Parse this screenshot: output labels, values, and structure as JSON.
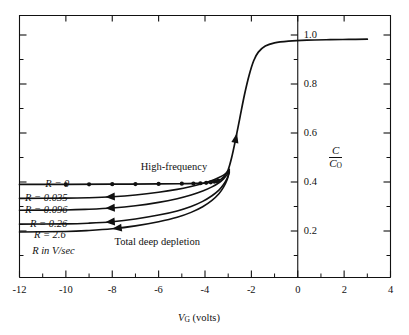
{
  "chart_data": {
    "type": "line",
    "title": "",
    "xlabel": "V_G (volts)",
    "ylabel": "C/C_O",
    "xlim": [
      -12,
      4
    ],
    "ylim": [
      0,
      1.08
    ],
    "xticks": [
      -12,
      -10,
      -8,
      -6,
      -4,
      -2,
      0,
      2,
      4
    ],
    "xtick_labels": [
      "-12",
      "-10",
      "-8",
      "-6",
      "-4",
      "-2",
      "0",
      "2",
      "4"
    ],
    "xminor_ticks": [
      -11,
      -9,
      -7,
      -5,
      -3,
      -1,
      1,
      3
    ],
    "yticks": [
      0.2,
      0.4,
      0.6,
      0.8,
      1.0
    ],
    "ytick_labels": [
      "0.2",
      "0.4",
      "0.6",
      "0.8",
      "1.0"
    ],
    "yminor_ticks": [
      0.1,
      0.3,
      0.5,
      0.7,
      0.9
    ],
    "y_axis_position": "x=0",
    "grid": false,
    "legend": "inline-labels",
    "annotations": [
      {
        "text": "High-frequency",
        "x": -5.3,
        "y": 0.455
      },
      {
        "text": "Total deep depletion",
        "x": -6.1,
        "y": 0.155
      }
    ],
    "series": [
      {
        "name": "R = 0",
        "label": "R = 0",
        "marker": "filled-circle",
        "comment": "high-frequency curve, flat at C/Co = 0.39 then rises into inversion branch",
        "points": [
          [
            -12,
            0.39
          ],
          [
            -10,
            0.39
          ],
          [
            -8,
            0.391
          ],
          [
            -6,
            0.392
          ],
          [
            -5,
            0.393
          ],
          [
            -4.4,
            0.394
          ],
          [
            -4.0,
            0.396
          ],
          [
            -3.7,
            0.399
          ],
          [
            -3.45,
            0.404
          ],
          [
            -3.3,
            0.412
          ],
          [
            -3.15,
            0.425
          ],
          [
            -3.0,
            0.45
          ],
          [
            -2.85,
            0.5
          ],
          [
            -2.7,
            0.565
          ],
          [
            -2.5,
            0.66
          ],
          [
            -2.3,
            0.755
          ],
          [
            -2.1,
            0.835
          ],
          [
            -1.9,
            0.895
          ],
          [
            -1.7,
            0.93
          ],
          [
            -1.4,
            0.955
          ],
          [
            -1.0,
            0.968
          ],
          [
            -0.4,
            0.975
          ],
          [
            0.4,
            0.979
          ],
          [
            1.4,
            0.981
          ],
          [
            2.2,
            0.982
          ],
          [
            3.0,
            0.983
          ]
        ],
        "marker_x": [
          -10,
          -9,
          -8,
          -7,
          -6,
          -5,
          -4.5,
          -4.2,
          -3.95,
          -3.75,
          -3.6,
          -3.5,
          -3.42
        ]
      },
      {
        "name": "R = 0.035",
        "label": "R = 0.035",
        "marker": "left-arrow",
        "points": [
          [
            -12,
            0.333
          ],
          [
            -10,
            0.334
          ],
          [
            -9,
            0.336
          ],
          [
            -8,
            0.34
          ],
          [
            -7,
            0.347
          ],
          [
            -6,
            0.358
          ],
          [
            -5.2,
            0.37
          ],
          [
            -4.6,
            0.382
          ],
          [
            -4.1,
            0.394
          ],
          [
            -3.7,
            0.406
          ],
          [
            -3.4,
            0.418
          ],
          [
            -3.2,
            0.428
          ],
          [
            -3.05,
            0.44
          ],
          [
            -2.95,
            0.452
          ]
        ],
        "arrow_x": -8.3
      },
      {
        "name": "R = 0.096",
        "label": "R = 0.096",
        "marker": "left-arrow",
        "points": [
          [
            -12,
            0.285
          ],
          [
            -10,
            0.286
          ],
          [
            -9,
            0.289
          ],
          [
            -8,
            0.294
          ],
          [
            -7,
            0.303
          ],
          [
            -6,
            0.317
          ],
          [
            -5.2,
            0.332
          ],
          [
            -4.6,
            0.347
          ],
          [
            -4.1,
            0.363
          ],
          [
            -3.7,
            0.38
          ],
          [
            -3.4,
            0.397
          ],
          [
            -3.2,
            0.413
          ],
          [
            -3.05,
            0.43
          ],
          [
            -2.95,
            0.448
          ]
        ],
        "arrow_x": -8.3
      },
      {
        "name": "R = 0.26",
        "label": "R = 0.26",
        "marker": "left-arrow",
        "points": [
          [
            -12,
            0.228
          ],
          [
            -10,
            0.229
          ],
          [
            -9,
            0.232
          ],
          [
            -8,
            0.238
          ],
          [
            -7,
            0.249
          ],
          [
            -6,
            0.265
          ],
          [
            -5.2,
            0.282
          ],
          [
            -4.6,
            0.3
          ],
          [
            -4.1,
            0.321
          ],
          [
            -3.7,
            0.344
          ],
          [
            -3.4,
            0.367
          ],
          [
            -3.2,
            0.39
          ],
          [
            -3.05,
            0.414
          ],
          [
            -2.95,
            0.442
          ]
        ],
        "arrow_x": -8.3
      },
      {
        "name": "R = 2.6",
        "label": "R = 2.6",
        "marker": "left-arrow",
        "points": [
          [
            -12,
            0.196
          ],
          [
            -10,
            0.198
          ],
          [
            -9,
            0.202
          ],
          [
            -8,
            0.209
          ],
          [
            -7,
            0.221
          ],
          [
            -6,
            0.238
          ],
          [
            -5.2,
            0.256
          ],
          [
            -4.6,
            0.276
          ],
          [
            -4.1,
            0.299
          ],
          [
            -3.7,
            0.325
          ],
          [
            -3.4,
            0.352
          ],
          [
            -3.2,
            0.379
          ],
          [
            -3.05,
            0.408
          ],
          [
            -2.95,
            0.44
          ]
        ],
        "arrow_x": -8.0
      }
    ],
    "series_note": "R in V/sec",
    "curve_arrow": {
      "x": -2.62,
      "y": 0.6,
      "direction": "up"
    }
  },
  "axis": {
    "x_label_main": "V",
    "x_label_sub": "G",
    "x_label_units": "(volts)",
    "y_label_num": "C",
    "y_label_den_main": "C",
    "y_label_den_sub": "O"
  },
  "series_labels": {
    "r0": "R = 0",
    "r1": "R = 0.035",
    "r2": "R = 0.096",
    "r3": "R = 0.26",
    "r4": "R = 2.6",
    "note": "R in V/sec"
  },
  "annotations": {
    "high_frequency": "High-frequency",
    "total_deep_depletion": "Total deep depletion"
  },
  "xtick_labels": {
    "t0": "-12",
    "t1": "-10",
    "t2": "-8",
    "t3": "-6",
    "t4": "-4",
    "t5": "-2",
    "t6": "0",
    "t7": "2",
    "t8": "4"
  },
  "ytick_labels": {
    "t0": "0.2",
    "t1": "0.4",
    "t2": "0.6",
    "t3": "0.8",
    "t4": "1.0"
  },
  "colors": {
    "ink": "#111111",
    "background": "#ffffff"
  }
}
